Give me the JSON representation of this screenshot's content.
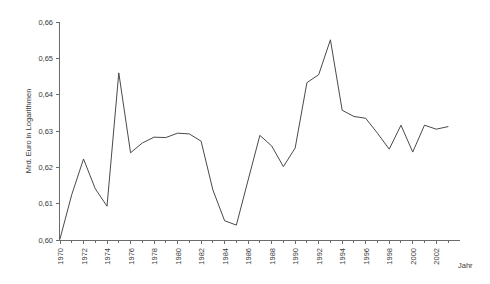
{
  "chart_data": {
    "type": "line",
    "title": "",
    "subtitle": "",
    "xlabel": "Jahr",
    "ylabel": "Mrd. Euro in Logarithmen",
    "xlim": [
      1970,
      2003
    ],
    "ylim": [
      0.6,
      0.66
    ],
    "grid": false,
    "legend": false,
    "legend_position": "none",
    "y_ticks": [
      "0,60",
      "0,61",
      "0,62",
      "0,63",
      "0,64",
      "0,65",
      "0,66"
    ],
    "y_tick_values": [
      0.6,
      0.61,
      0.62,
      0.63,
      0.64,
      0.65,
      0.66
    ],
    "x_ticks": [
      "1970",
      "1972",
      "1974",
      "1976",
      "1978",
      "1980",
      "1982",
      "1984",
      "1986",
      "1988",
      "1990",
      "1992",
      "1994",
      "1996",
      "1998",
      "2000",
      "2002"
    ],
    "x_tick_values": [
      1970,
      1972,
      1974,
      1976,
      1978,
      1980,
      1982,
      1984,
      1986,
      1988,
      1990,
      1992,
      1994,
      1996,
      1998,
      2000,
      2002
    ],
    "x": [
      1970,
      1971,
      1972,
      1973,
      1974,
      1975,
      1976,
      1977,
      1978,
      1979,
      1980,
      1981,
      1982,
      1983,
      1984,
      1985,
      1986,
      1987,
      1988,
      1989,
      1990,
      1991,
      1992,
      1993,
      1994,
      1995,
      1996,
      1997,
      1998,
      1999,
      2000,
      2001,
      2002,
      2003
    ],
    "values": [
      0.6003,
      0.6125,
      0.6223,
      0.6141,
      0.6093,
      0.646,
      0.624,
      0.6267,
      0.6283,
      0.6282,
      0.6294,
      0.6292,
      0.6272,
      0.6138,
      0.6053,
      0.6041,
      0.6165,
      0.6288,
      0.6259,
      0.6202,
      0.6253,
      0.6433,
      0.6455,
      0.6551,
      0.6357,
      0.634,
      0.6335,
      0.6294,
      0.625,
      0.6316,
      0.6242,
      0.6316,
      0.6305,
      0.6312
    ],
    "series_name": "Mrd. Euro in Logarithmen",
    "line_color": "#4a4a4a",
    "axis_color": "#6b6b6b",
    "background_color": "#ffffff"
  }
}
